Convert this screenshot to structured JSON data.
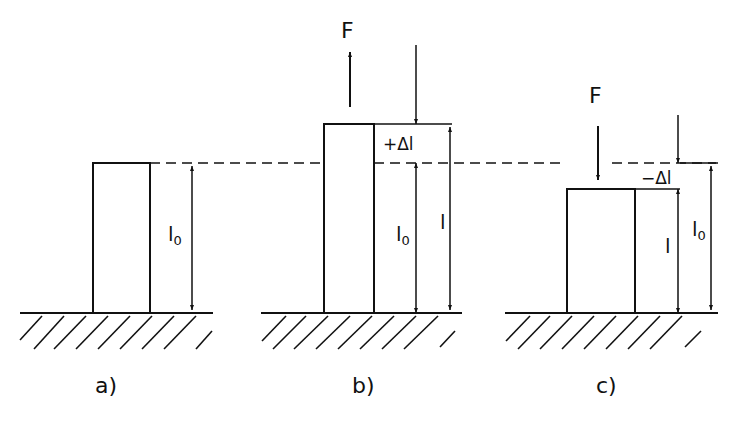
{
  "figure": {
    "colors": {
      "stroke": "#111111",
      "background": "#ffffff"
    },
    "reference_line": {
      "style": "dashed",
      "meaning": "original height l0"
    },
    "panels": [
      {
        "id": "a",
        "caption": "a)",
        "state": "unloaded",
        "dimensions": [
          {
            "symbol": "l",
            "subscript": "0"
          }
        ]
      },
      {
        "id": "b",
        "caption": "b)",
        "state": "tension",
        "force_label": "F",
        "force_direction": "up",
        "dimensions": [
          {
            "symbol": "+Δl",
            "subscript": ""
          },
          {
            "symbol": "l",
            "subscript": "0"
          },
          {
            "symbol": "l",
            "subscript": ""
          }
        ]
      },
      {
        "id": "c",
        "caption": "c)",
        "state": "compression",
        "force_label": "F",
        "force_direction": "down",
        "dimensions": [
          {
            "symbol": "−Δl",
            "subscript": ""
          },
          {
            "symbol": "l",
            "subscript": ""
          },
          {
            "symbol": "l",
            "subscript": "0"
          }
        ]
      }
    ]
  }
}
